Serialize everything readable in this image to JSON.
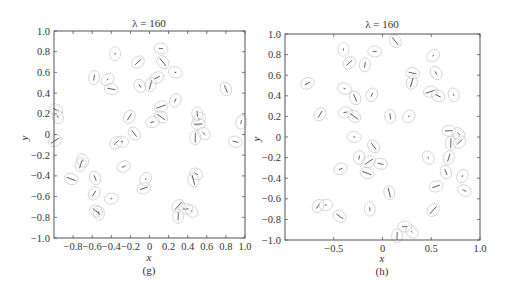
{
  "chart_data": [
    {
      "type": "scatter",
      "panel": "(g)",
      "title": "λ = 160",
      "xlabel": "x",
      "ylabel": "y",
      "xlim": [
        -1.0,
        1.0
      ],
      "ylim": [
        -1.0,
        1.0
      ],
      "xticks": [
        "-0.8",
        "-0.6",
        "-0.4",
        "-0.2",
        "0",
        "0.2",
        "0.4",
        "0.6",
        "0.8",
        "1.0"
      ],
      "yticks": [
        "1.0",
        "0.8",
        "0.6",
        "0.4",
        "0.2",
        "0",
        "-0.2",
        "-0.4",
        "-0.6",
        "-0.8",
        "-1.0"
      ],
      "grid": false,
      "marker": "ellipse with orientation segment",
      "points": [
        [
          -0.36,
          0.78
        ],
        [
          -0.12,
          0.7
        ],
        [
          0.12,
          0.83
        ],
        [
          0.14,
          0.7
        ],
        [
          -0.58,
          0.55
        ],
        [
          -0.44,
          0.53
        ],
        [
          -0.4,
          0.44
        ],
        [
          -0.1,
          0.47
        ],
        [
          0.01,
          0.48
        ],
        [
          0.08,
          0.55
        ],
        [
          0.27,
          0.6
        ],
        [
          0.8,
          0.44
        ],
        [
          0.27,
          0.33
        ],
        [
          0.12,
          0.27
        ],
        [
          -0.98,
          0.24
        ],
        [
          -0.96,
          0.17
        ],
        [
          -0.21,
          0.17
        ],
        [
          0.03,
          0.12
        ],
        [
          0.12,
          0.17
        ],
        [
          0.5,
          0.2
        ],
        [
          0.52,
          0.15
        ],
        [
          0.51,
          0.1
        ],
        [
          0.57,
          0.01
        ],
        [
          0.48,
          -0.03
        ],
        [
          -0.35,
          -0.08
        ],
        [
          -0.29,
          -0.07
        ],
        [
          -0.16,
          0.01
        ],
        [
          0.96,
          0.12
        ],
        [
          -0.99,
          -0.06
        ],
        [
          0.9,
          -0.07
        ],
        [
          -0.7,
          -0.25
        ],
        [
          -0.72,
          -0.29
        ],
        [
          -0.27,
          -0.31
        ],
        [
          -0.82,
          -0.43
        ],
        [
          -0.57,
          -0.42
        ],
        [
          -0.04,
          -0.43
        ],
        [
          -0.06,
          -0.52
        ],
        [
          0.49,
          -0.38
        ],
        [
          0.46,
          -0.44
        ],
        [
          -0.58,
          -0.57
        ],
        [
          -0.4,
          -0.62
        ],
        [
          -0.56,
          -0.74
        ],
        [
          -0.53,
          -0.76
        ],
        [
          0.3,
          -0.69
        ],
        [
          0.38,
          -0.72
        ],
        [
          0.44,
          -0.74
        ],
        [
          0.3,
          -0.79
        ]
      ]
    },
    {
      "type": "scatter",
      "panel": "(h)",
      "title": "λ = 160",
      "xlabel": "x",
      "ylabel": "y",
      "xlim": [
        -1.0,
        1.0
      ],
      "ylim": [
        -1.0,
        1.0
      ],
      "xticks": [
        "-0.5",
        "0",
        "0.5",
        "1.0"
      ],
      "yticks": [
        "1.0",
        "0.8",
        "0.6",
        "0.4",
        "0.2",
        "0",
        "-0.2",
        "-0.4",
        "-0.6",
        "-0.8",
        "-1.0"
      ],
      "grid": false,
      "marker": "ellipse with orientation segment",
      "points": [
        [
          -0.4,
          0.85
        ],
        [
          -0.34,
          0.72
        ],
        [
          -0.08,
          0.83
        ],
        [
          0.13,
          0.93
        ],
        [
          -0.18,
          0.7
        ],
        [
          0.52,
          0.79
        ],
        [
          0.31,
          0.62
        ],
        [
          0.55,
          0.62
        ],
        [
          0.3,
          0.53
        ],
        [
          -0.77,
          0.52
        ],
        [
          -0.39,
          0.47
        ],
        [
          -0.28,
          0.38
        ],
        [
          -0.11,
          0.41
        ],
        [
          0.49,
          0.44
        ],
        [
          0.57,
          0.4
        ],
        [
          0.73,
          0.41
        ],
        [
          -0.64,
          0.22
        ],
        [
          -0.38,
          0.24
        ],
        [
          -0.29,
          0.2
        ],
        [
          0.08,
          0.2
        ],
        [
          0.27,
          0.2
        ],
        [
          0.68,
          0.06
        ],
        [
          0.78,
          0.03
        ],
        [
          0.7,
          -0.06
        ],
        [
          0.79,
          -0.05
        ],
        [
          -0.29,
          0.0
        ],
        [
          -0.09,
          -0.09
        ],
        [
          -0.24,
          -0.2
        ],
        [
          -0.14,
          -0.24
        ],
        [
          -0.02,
          -0.26
        ],
        [
          0.47,
          -0.2
        ],
        [
          0.68,
          -0.2
        ],
        [
          -0.43,
          -0.31
        ],
        [
          -0.16,
          -0.35
        ],
        [
          0.65,
          -0.34
        ],
        [
          0.82,
          -0.38
        ],
        [
          0.55,
          -0.48
        ],
        [
          0.84,
          -0.52
        ],
        [
          0.07,
          -0.54
        ],
        [
          -0.66,
          -0.67
        ],
        [
          -0.58,
          -0.66
        ],
        [
          -0.44,
          -0.77
        ],
        [
          -0.13,
          -0.7
        ],
        [
          0.52,
          -0.71
        ],
        [
          0.23,
          -0.87
        ],
        [
          0.3,
          -0.92
        ],
        [
          0.15,
          -0.96
        ]
      ]
    }
  ],
  "panels": {
    "left": {
      "title": "λ = 160",
      "xlabel": "x",
      "ylabel": "y",
      "caption": "(g)",
      "xticks": [
        "−0.8",
        "−0.6",
        "−0.4",
        "−0.2",
        "0",
        "0.2",
        "0.4",
        "0.6",
        "0.8",
        "1.0"
      ],
      "yticks": [
        "1.0",
        "0.8",
        "0.6",
        "0.4",
        "0.2",
        "0",
        "−0.2",
        "−0.4",
        "−0.6",
        "−0.8",
        "−1.0"
      ]
    },
    "right": {
      "title": "λ = 160",
      "xlabel": "x",
      "ylabel": "y",
      "caption": "(h)",
      "xticks": [
        "−0.5",
        "0",
        "0.5",
        "1.0"
      ],
      "yticks": [
        "1.0",
        "0.8",
        "0.6",
        "0.4",
        "0.2",
        "0",
        "−0.2",
        "−0.4",
        "−0.6",
        "−0.8",
        "−1.0"
      ]
    }
  }
}
